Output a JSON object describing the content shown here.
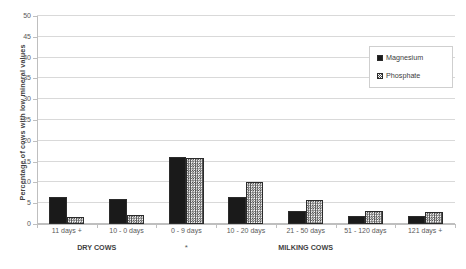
{
  "chart_data": {
    "type": "bar",
    "title": "",
    "xlabel": "",
    "ylabel": "Percentage of cows with low  mineral values",
    "ylim": [
      0,
      50
    ],
    "ytick_step": 5,
    "yticks": [
      0,
      5,
      10,
      15,
      20,
      25,
      30,
      35,
      40,
      45,
      50
    ],
    "grid": true,
    "legend_position": "top-right",
    "categories": [
      "11 days +",
      "10 - 0 days",
      "0 - 9 days",
      "10 - 20 days",
      "21 - 50 days",
      "51 - 120 days",
      "121 days +"
    ],
    "series": [
      {
        "name": "Magnesium",
        "color": "#1a1a1a",
        "pattern": "solid",
        "values": [
          6.5,
          5.9,
          16.2,
          6.6,
          3.2,
          1.9,
          2.0
        ]
      },
      {
        "name": "Phosphate",
        "color": "#4d4d4d",
        "pattern": "crosshatch",
        "values": [
          1.6,
          2.2,
          15.8,
          10.0,
          5.7,
          3.2,
          2.8
        ]
      }
    ],
    "group_captions": [
      {
        "label": "DRY COWS",
        "categories": [
          "11 days +",
          "10 - 0 days"
        ]
      },
      {
        "label": "MILKING COWS",
        "categories": [
          "0 - 9 days",
          "10 - 20 days",
          "21 - 50 days",
          "51 - 120 days",
          "121 days +"
        ]
      }
    ],
    "annotations": [
      {
        "text": "*",
        "category": "0 - 9 days"
      }
    ]
  },
  "legend": {
    "items": [
      {
        "label": "Magnesium"
      },
      {
        "label": "Phosphate"
      }
    ]
  }
}
